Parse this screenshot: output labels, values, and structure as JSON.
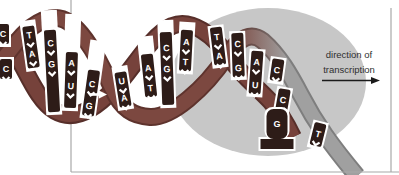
{
  "figure": {
    "label": {
      "line1": "direction of",
      "line2": "transcription"
    },
    "helix": {
      "columns": [
        {
          "x": 3,
          "tilt": 0,
          "top": 24,
          "bot": 44,
          "bases": [
            {
              "l": "C",
              "y": 34
            }
          ]
        },
        {
          "x": 6,
          "tilt": 0,
          "top": 59,
          "bot": 79,
          "bases": [
            {
              "l": "C",
              "y": 69
            }
          ]
        },
        {
          "x": 31,
          "tilt": -8,
          "top": 26,
          "bot": 68,
          "wtop": 20,
          "bases": [
            {
              "l": "T",
              "y": 35
            },
            {
              "l": "A",
              "y": 54
            }
          ]
        },
        {
          "x": 52,
          "tilt": -3,
          "top": 30,
          "bot": 112,
          "wtop": 10,
          "bases": [
            {
              "l": "C",
              "y": 43
            },
            {
              "l": "G",
              "y": 64
            }
          ]
        },
        {
          "x": 71,
          "tilt": 2,
          "top": 52,
          "bot": 108,
          "wtop": 14,
          "bases": [
            {
              "l": "A",
              "y": 63
            },
            {
              "l": "U",
              "y": 86
            }
          ]
        },
        {
          "x": 91,
          "tilt": 8,
          "top": 70,
          "bot": 116,
          "wtop": 40,
          "bases": [
            {
              "l": "C",
              "y": 84
            },
            {
              "l": "G",
              "y": 106
            }
          ]
        },
        {
          "x": 123,
          "tilt": -9,
          "top": 72,
          "bot": 107,
          "wtop": 66,
          "bases": [
            {
              "l": "U",
              "y": 81
            },
            {
              "l": "A",
              "y": 98
            }
          ]
        },
        {
          "x": 149,
          "tilt": -6,
          "top": 54,
          "bot": 97,
          "wtop": 36,
          "bases": [
            {
              "l": "A",
              "y": 68
            },
            {
              "l": "T",
              "y": 88
            }
          ]
        },
        {
          "x": 167,
          "tilt": -2,
          "top": 32,
          "bot": 105,
          "wtop": 20,
          "bases": [
            {
              "l": "C",
              "y": 48
            },
            {
              "l": "G",
              "y": 69
            }
          ]
        },
        {
          "x": 186,
          "tilt": 3,
          "top": 30,
          "bot": 71,
          "wtop": 22,
          "bases": [
            {
              "l": "A",
              "y": 42
            },
            {
              "l": "T",
              "y": 62
            }
          ]
        },
        {
          "x": 218,
          "tilt": -7,
          "top": 27,
          "bot": 65,
          "bases": [
            {
              "l": "T",
              "y": 37
            },
            {
              "l": "A",
              "y": 56
            }
          ]
        },
        {
          "x": 238,
          "tilt": -2,
          "top": 33,
          "bot": 77,
          "bases": [
            {
              "l": "C",
              "y": 44
            },
            {
              "l": "G",
              "y": 68
            }
          ]
        },
        {
          "x": 256,
          "tilt": 4,
          "top": 51,
          "bot": 94,
          "bases": [
            {
              "l": "A",
              "y": 62
            },
            {
              "l": "U",
              "y": 85
            }
          ]
        },
        {
          "x": 277,
          "tilt": 8,
          "top": 59,
          "bot": 81,
          "bases": [
            {
              "l": "C",
              "y": 70
            }
          ]
        },
        {
          "x": 283,
          "tilt": 10,
          "top": 89,
          "bot": 111,
          "bases": [
            {
              "l": "C",
              "y": 100
            }
          ]
        },
        {
          "x": 318,
          "tilt": 14,
          "top": 123,
          "bot": 146,
          "bases": [
            {
              "l": "T",
              "y": 134
            }
          ]
        }
      ],
      "pedestal": {
        "x": 277,
        "letter": "G",
        "letter_y": 124,
        "stem_top": 109,
        "stem_bottom": 139,
        "stem_width": 21,
        "base_y": 139,
        "base_width": 33,
        "base_height": 10
      }
    },
    "colors": {
      "strand_front": "#7c4840",
      "strand_front_dark": "#5e332d",
      "strand_back": "#76423b",
      "strand_back_dark": "#572f2a",
      "strand_exit": "#a0a0a0",
      "strand_exit_dark": "#7e7e7e",
      "tab": "#2d1c18",
      "polymerase_oval": "#c7c7c7",
      "letter": "#ffffff",
      "label_text": "#2f2f2f",
      "border": "#a8a8a8",
      "arrow": "#1a1a1a"
    }
  }
}
